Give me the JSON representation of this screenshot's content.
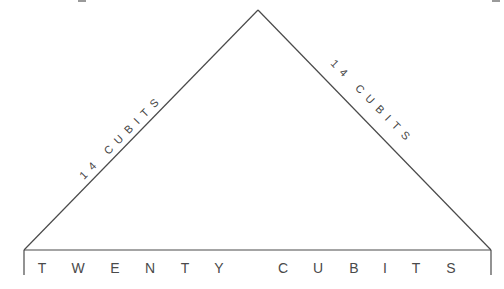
{
  "diagram": {
    "type": "triangle-dimension-diagram",
    "shape": "isosceles-triangle",
    "vertices": {
      "apex": [
        258,
        10
      ],
      "base_left": [
        24,
        250
      ],
      "base_right": [
        491,
        250
      ]
    },
    "left_side": {
      "label": "14 CUBITS"
    },
    "right_side": {
      "label": "14 CUBITS"
    },
    "base": {
      "label": "TWENTY CUBITS",
      "letters": [
        "T",
        "W",
        "E",
        "N",
        "T",
        "Y",
        "C",
        "U",
        "B",
        "I",
        "T",
        "S"
      ],
      "letter_x": [
        42,
        78,
        115,
        150,
        185,
        219,
        283,
        318,
        354,
        385,
        416,
        451
      ]
    },
    "colors": {
      "line": "#4a4a4a",
      "text": "#444444",
      "background": "#ffffff"
    }
  }
}
